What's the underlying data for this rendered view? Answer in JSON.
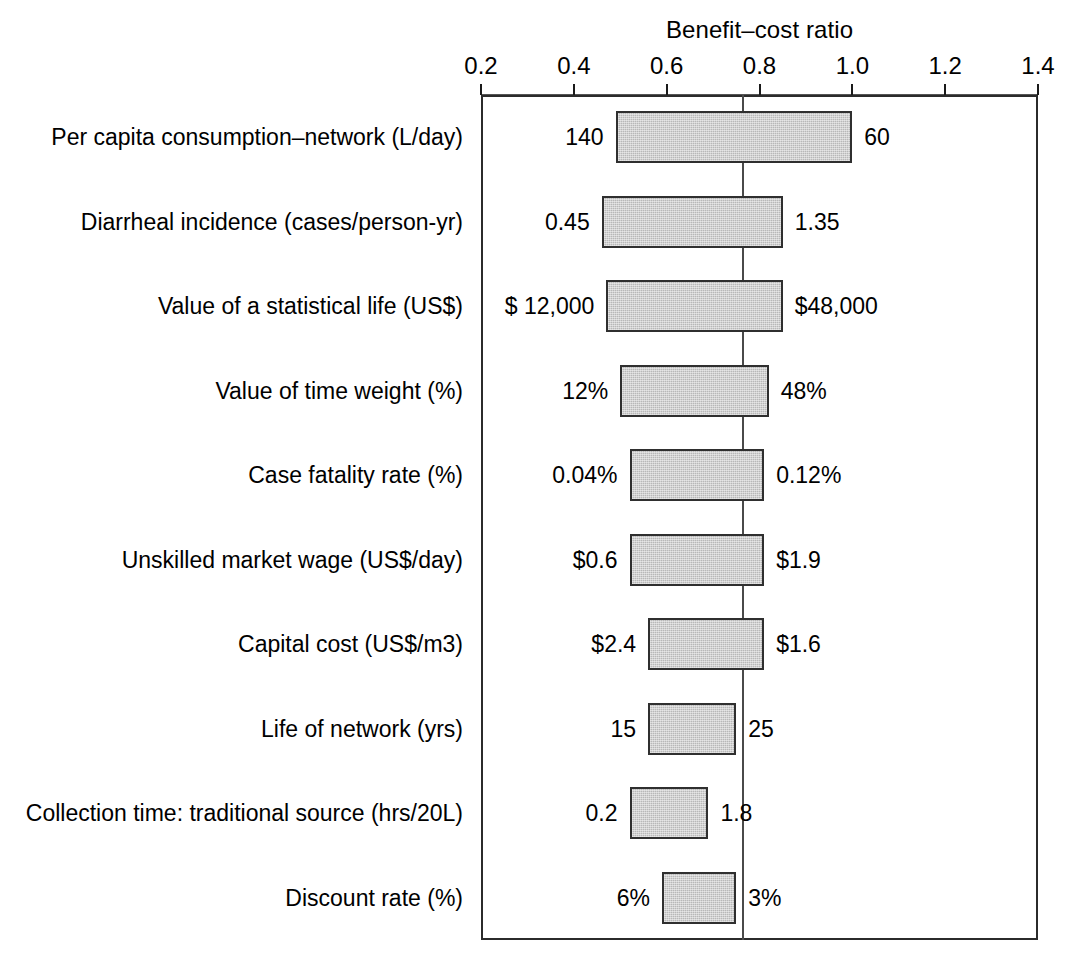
{
  "chart_data": {
    "type": "bar",
    "chart_subtype": "tornado",
    "title": "Benefit–cost ratio",
    "xlabel": "Benefit–cost ratio",
    "ylabel": "",
    "xlim": [
      0.2,
      1.4
    ],
    "xticks": [
      0.2,
      0.4,
      0.6,
      0.8,
      1.0,
      1.2,
      1.4
    ],
    "xtick_labels": [
      "0.2",
      "0.4",
      "0.6",
      "0.8",
      "1.0",
      "1.2",
      "1.4"
    ],
    "grid": false,
    "legend": null,
    "baseline": 0.765,
    "categories": [
      "Per capita consumption–network (L/day)",
      "Diarrheal incidence (cases/person-yr)",
      "Value of a statistical life (US$)",
      "Value of time weight (%)",
      "Case fatality rate (%)",
      "Unskilled market wage (US$/day)",
      "Capital cost (US$/m3)",
      "Life of network (yrs)",
      "Collection time: traditional source (hrs/20L)",
      "Discount rate (%)"
    ],
    "bars": [
      {
        "label": "Per capita consumption–network (L/day)",
        "low": 0.49,
        "high": 1.0,
        "low_annotation": "140",
        "high_annotation": "60"
      },
      {
        "label": "Diarrheal incidence (cases/person-yr)",
        "low": 0.46,
        "high": 0.85,
        "low_annotation": "0.45",
        "high_annotation": "1.35"
      },
      {
        "label": "Value of a statistical life (US$)",
        "low": 0.47,
        "high": 0.85,
        "low_annotation": "$ 12,000",
        "high_annotation": "$48,000"
      },
      {
        "label": "Value of time weight (%)",
        "low": 0.5,
        "high": 0.82,
        "low_annotation": "12%",
        "high_annotation": "48%"
      },
      {
        "label": "Case fatality rate (%)",
        "low": 0.52,
        "high": 0.81,
        "low_annotation": "0.04%",
        "high_annotation": "0.12%"
      },
      {
        "label": "Unskilled market wage (US$/day)",
        "low": 0.52,
        "high": 0.81,
        "low_annotation": "$0.6",
        "high_annotation": "$1.9"
      },
      {
        "label": "Capital cost (US$/m3)",
        "low": 0.56,
        "high": 0.81,
        "low_annotation": "$2.4",
        "high_annotation": "$1.6"
      },
      {
        "label": "Life of network (yrs)",
        "low": 0.56,
        "high": 0.75,
        "low_annotation": "15",
        "high_annotation": "25"
      },
      {
        "label": "Collection time: traditional source (hrs/20L)",
        "low": 0.52,
        "high": 0.69,
        "low_annotation": "0.2",
        "high_annotation": "1.8"
      },
      {
        "label": "Discount rate (%)",
        "low": 0.59,
        "high": 0.75,
        "low_annotation": "6%",
        "high_annotation": "3%"
      }
    ],
    "colors": {
      "bar_fill": "#b8b8b8",
      "bar_border": "#2f2f2f",
      "axis": "#2b2b2b",
      "center_line": "#4a4a4a",
      "text": "#000000",
      "background": "#ffffff"
    }
  }
}
